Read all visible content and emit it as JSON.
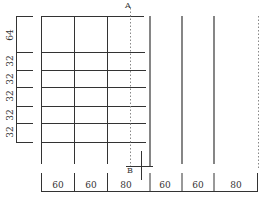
{
  "diagram": {
    "type": "grid-layout-dimension-drawing",
    "labels": {
      "top_marker": "A",
      "bottom_marker": "B"
    },
    "vertical_dimensions": [
      "64",
      "32",
      "32",
      "32",
      "32",
      "32"
    ],
    "horizontal_dimensions": [
      "60",
      "60",
      "80",
      "60",
      "60",
      "80"
    ],
    "colors": {
      "line": "#333333",
      "dotted": "#888888",
      "background": "#ffffff"
    }
  }
}
